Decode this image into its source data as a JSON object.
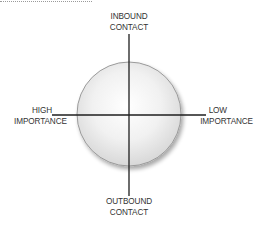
{
  "diagram": {
    "type": "quadrant-axes-with-circle",
    "axes": {
      "vertical": {
        "top_label": [
          "INBOUND",
          "CONTACT"
        ],
        "bottom_label": [
          "OUTBOUND",
          "CONTACT"
        ]
      },
      "horizontal": {
        "left_label": [
          "HIGH",
          "IMPORTANCE"
        ],
        "right_label": [
          "LOW",
          "IMPORTANCE"
        ]
      }
    },
    "colors": {
      "axis_line": "#1e1e1e",
      "circle_fill_center": "#ffffff",
      "circle_fill_edge": "#dcdcdc",
      "circle_stroke": "#9a9a9a",
      "label_text": "#333333",
      "top_rule": "#9a9a9a"
    }
  }
}
